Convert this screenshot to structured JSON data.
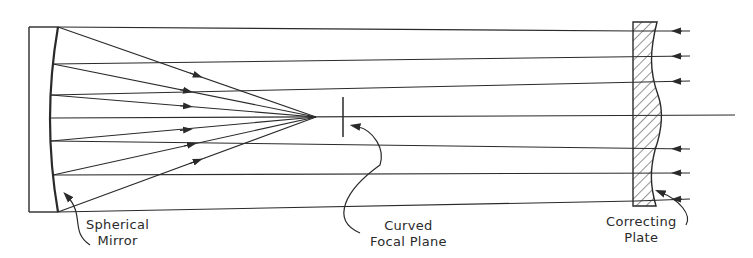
{
  "diagram": {
    "type": "Schmidt camera optical schematic",
    "labels": {
      "mirror": {
        "line1": "Spherical",
        "line2": "Mirror"
      },
      "focal_plane": {
        "line1": "Curved",
        "line2": "Focal Plane"
      },
      "plate": {
        "line1": "Correcting",
        "line2": "Plate"
      }
    },
    "colors": {
      "line": "#2a2a2a",
      "background": "#ffffff"
    }
  }
}
